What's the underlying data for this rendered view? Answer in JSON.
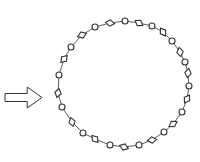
{
  "diagram": {
    "type": "ring-of-alternating-shapes",
    "colors": {
      "stroke": "#333333",
      "fill": "#ffffff",
      "background": "#ffffff"
    },
    "arrow": {
      "direction": "right",
      "x": 5,
      "y": 87,
      "length": 37,
      "height": 21
    },
    "ring": {
      "center": [
        124,
        85
      ],
      "nodes": [
        {
          "shape": "diamond",
          "x": 110,
          "y": 23
        },
        {
          "shape": "circle",
          "x": 125,
          "y": 21
        },
        {
          "shape": "diamond",
          "x": 139,
          "y": 23
        },
        {
          "shape": "circle",
          "x": 152,
          "y": 26
        },
        {
          "shape": "diamond",
          "x": 163,
          "y": 32
        },
        {
          "shape": "circle",
          "x": 172,
          "y": 41
        },
        {
          "shape": "diamond",
          "x": 180,
          "y": 52
        },
        {
          "shape": "circle",
          "x": 185,
          "y": 62
        },
        {
          "shape": "diamond",
          "x": 188,
          "y": 73
        },
        {
          "shape": "circle",
          "x": 189,
          "y": 86
        },
        {
          "shape": "diamond",
          "x": 187,
          "y": 99
        },
        {
          "shape": "circle",
          "x": 182,
          "y": 112
        },
        {
          "shape": "diamond",
          "x": 173,
          "y": 124
        },
        {
          "shape": "circle",
          "x": 164,
          "y": 132
        },
        {
          "shape": "diamond",
          "x": 152,
          "y": 140
        },
        {
          "shape": "circle",
          "x": 139,
          "y": 145
        },
        {
          "shape": "diamond",
          "x": 124,
          "y": 147
        },
        {
          "shape": "circle",
          "x": 110,
          "y": 145
        },
        {
          "shape": "diamond",
          "x": 95,
          "y": 139
        },
        {
          "shape": "circle",
          "x": 83,
          "y": 133
        },
        {
          "shape": "diamond",
          "x": 72,
          "y": 122
        },
        {
          "shape": "circle",
          "x": 62,
          "y": 107
        },
        {
          "shape": "diamond",
          "x": 58,
          "y": 93
        },
        {
          "shape": "circle",
          "x": 59,
          "y": 75
        },
        {
          "shape": "diamond",
          "x": 64,
          "y": 59
        },
        {
          "shape": "circle",
          "x": 71,
          "y": 47
        },
        {
          "shape": "diamond",
          "x": 82,
          "y": 35
        },
        {
          "shape": "circle",
          "x": 95,
          "y": 27
        }
      ]
    }
  }
}
